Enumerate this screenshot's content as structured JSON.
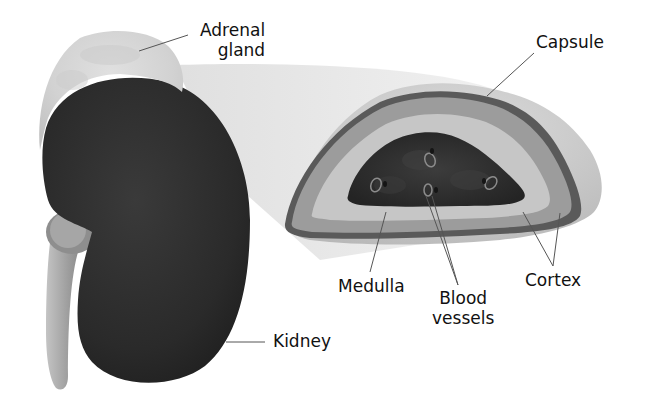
{
  "diagram": {
    "colors": {
      "background": "#ffffff",
      "kidney": "#2b2b2b",
      "ureter": "#a8a8a8",
      "adrenal_gland": "#d4d4d4",
      "capsule_outer": "#5a5a5a",
      "cortex_outer": "#9a9a9a",
      "cortex_inner": "#c8c8c8",
      "medulla": "#2e2e2e",
      "vessel": "#8c8c8c",
      "projection": "#e6e6e6",
      "leader_line": "#555555"
    },
    "labels": {
      "adrenal_gland": [
        "Adrenal",
        "gland"
      ],
      "capsule": "Capsule",
      "medulla": "Medulla",
      "blood_vessels": [
        "Blood",
        "vessels"
      ],
      "cortex": "Cortex",
      "kidney": "Kidney"
    }
  }
}
